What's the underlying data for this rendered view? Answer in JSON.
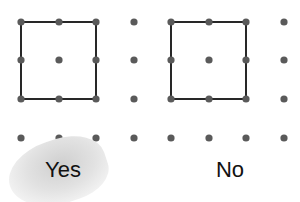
{
  "grid": {
    "columns_x": [
      21,
      59,
      96,
      134,
      171,
      209,
      246,
      284
    ],
    "rows_y": [
      22,
      60,
      99,
      138
    ],
    "dot_color": "#5a5a5a",
    "dot_radius": 3.6
  },
  "squares": [
    {
      "x": 21,
      "y": 22,
      "w": 75,
      "h": 77,
      "stroke": "#111111"
    },
    {
      "x": 171,
      "y": 22,
      "w": 75,
      "h": 77,
      "stroke": "#111111"
    }
  ],
  "options": {
    "yes": {
      "label": "Yes",
      "x": 63,
      "y": 157
    },
    "no": {
      "label": "No",
      "x": 230,
      "y": 157
    }
  }
}
